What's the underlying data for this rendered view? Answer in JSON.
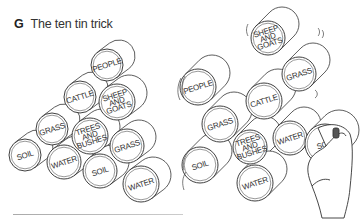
{
  "figure": {
    "letter": "G",
    "title": "The ten tin trick"
  },
  "left_stack": {
    "tins": [
      {
        "label": "PEOPLE",
        "cx": 107,
        "cy": 65,
        "r": 16
      },
      {
        "label": "CATTLE",
        "cx": 80,
        "cy": 97,
        "r": 16
      },
      {
        "label": "SHEEP AND GOATS",
        "cx": 117,
        "cy": 102,
        "r": 18
      },
      {
        "label": "GRASS",
        "cx": 52,
        "cy": 129,
        "r": 16
      },
      {
        "label": "TREES AND BUSHES",
        "cx": 90,
        "cy": 136,
        "r": 18
      },
      {
        "label": "GRASS",
        "cx": 127,
        "cy": 146,
        "r": 17
      },
      {
        "label": "SOIL",
        "cx": 25,
        "cy": 155,
        "r": 16
      },
      {
        "label": "WATER",
        "cx": 64,
        "cy": 162,
        "r": 17
      },
      {
        "label": "SOIL",
        "cx": 100,
        "cy": 171,
        "r": 17
      },
      {
        "label": "WATER",
        "cx": 141,
        "cy": 184,
        "r": 18
      }
    ]
  },
  "right_stack": {
    "tins": [
      {
        "label": "SHEEP AND GOATS",
        "cx": 268,
        "cy": 38,
        "r": 17
      },
      {
        "label": "PEOPLE",
        "cx": 198,
        "cy": 87,
        "r": 18
      },
      {
        "label": "GRASS",
        "cx": 299,
        "cy": 74,
        "r": 17
      },
      {
        "label": "CATTLE",
        "cx": 264,
        "cy": 101,
        "r": 18
      },
      {
        "label": "GRASS",
        "cx": 220,
        "cy": 124,
        "r": 18
      },
      {
        "label": "TREES AND BUSHES",
        "cx": 250,
        "cy": 147,
        "r": 17
      },
      {
        "label": "WATER",
        "cx": 290,
        "cy": 138,
        "r": 17
      },
      {
        "label": "SOIL",
        "cx": 325,
        "cy": 144,
        "r": 20
      },
      {
        "label": "SOIL",
        "cx": 200,
        "cy": 165,
        "r": 18
      },
      {
        "label": "WATER",
        "cx": 255,
        "cy": 183,
        "r": 18
      }
    ]
  },
  "colors": {
    "ink": "#2a2a2a",
    "paper": "#ffffff"
  }
}
